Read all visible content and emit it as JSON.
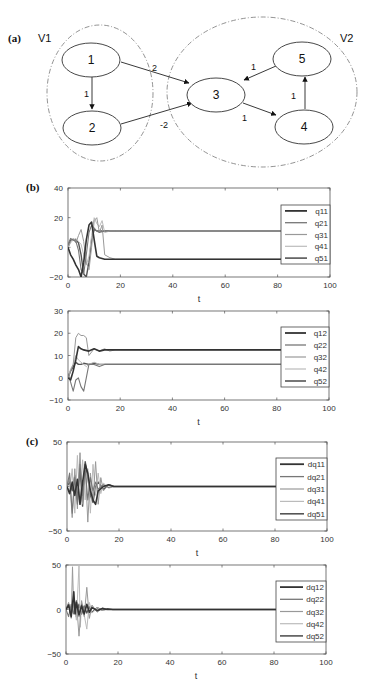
{
  "panel_labels": {
    "a": "(a)",
    "b": "(b)",
    "c": "(c)"
  },
  "diagram": {
    "sets": [
      {
        "label": "V1",
        "cx": 100,
        "cy": 93,
        "rx": 53,
        "ry": 68,
        "label_x": 38,
        "label_y": 42
      },
      {
        "label": "V2",
        "cx": 262,
        "cy": 92,
        "rx": 95,
        "ry": 75,
        "label_x": 340,
        "label_y": 42
      }
    ],
    "nodes": [
      {
        "id": "1",
        "label": "1",
        "cx": 91,
        "cy": 60,
        "rx": 29,
        "ry": 17
      },
      {
        "id": "2",
        "label": "2",
        "cx": 92,
        "cy": 128,
        "rx": 29,
        "ry": 17
      },
      {
        "id": "3",
        "label": "3",
        "cx": 216,
        "cy": 95,
        "rx": 29,
        "ry": 17
      },
      {
        "id": "4",
        "label": "4",
        "cx": 304,
        "cy": 127,
        "rx": 29,
        "ry": 17
      },
      {
        "id": "5",
        "label": "5",
        "cx": 302,
        "cy": 59,
        "rx": 29,
        "ry": 17
      }
    ],
    "edges": [
      {
        "from": "1",
        "to": "2",
        "weight": "1",
        "x1": 92,
        "y1": 77,
        "x2": 92,
        "y2": 109,
        "lx": 84,
        "ly": 97
      },
      {
        "from": "1",
        "to": "3",
        "weight": "2",
        "x1": 121,
        "y1": 62,
        "x2": 189,
        "y2": 83,
        "lx": 152,
        "ly": 71
      },
      {
        "from": "2",
        "to": "3",
        "weight": "-2",
        "x1": 121,
        "y1": 124,
        "x2": 192,
        "y2": 103,
        "lx": 160,
        "ly": 128
      },
      {
        "from": "3",
        "to": "4",
        "weight": "1",
        "x1": 243,
        "y1": 103,
        "x2": 276,
        "y2": 115,
        "lx": 242,
        "ly": 121
      },
      {
        "from": "4",
        "to": "5",
        "weight": "1",
        "x1": 305,
        "y1": 109,
        "x2": 305,
        "y2": 77,
        "lx": 291,
        "ly": 99
      },
      {
        "from": "5",
        "to": "3",
        "weight": "1",
        "x1": 276,
        "y1": 66,
        "x2": 244,
        "y2": 80,
        "lx": 251,
        "ly": 70
      }
    ]
  },
  "chart_data": [
    {
      "type": "line",
      "panel": "(b)",
      "title": "",
      "xlabel": "t",
      "ylabel": "",
      "xlim": [
        0,
        100
      ],
      "ylim": [
        -20,
        40
      ],
      "xticks": [
        0,
        20,
        40,
        60,
        80,
        100
      ],
      "yticks": [
        -20,
        0,
        20,
        40
      ],
      "grid": false,
      "legend_position": "right",
      "frame": {
        "x": 68,
        "y": 188,
        "w": 262,
        "h": 89
      },
      "legend_box": {
        "x": 281,
        "y": 205,
        "w": 49,
        "h": 59
      },
      "series": [
        {
          "name": "q11",
          "color": "#333333",
          "width": 1.6,
          "x": [
            0,
            1,
            2,
            3,
            4,
            5,
            6,
            7,
            8,
            9,
            10,
            11,
            12,
            14,
            16,
            18,
            20,
            100
          ],
          "y": [
            0,
            -5,
            -8,
            -12,
            -15,
            -20,
            -10,
            5,
            15,
            17,
            5,
            -6,
            -7,
            -8,
            -8,
            -8,
            -8,
            -8
          ]
        },
        {
          "name": "q21",
          "color": "#777777",
          "width": 1.1,
          "x": [
            0,
            1,
            2,
            3,
            4,
            5,
            6,
            7,
            8,
            9,
            10,
            11,
            12,
            14,
            16,
            18,
            20,
            100
          ],
          "y": [
            2,
            6,
            5,
            4,
            -2,
            -15,
            -18,
            -5,
            10,
            15,
            13,
            11,
            10,
            11,
            11,
            11,
            11,
            11
          ]
        },
        {
          "name": "q31",
          "color": "#999999",
          "width": 1.0,
          "x": [
            0,
            1,
            2,
            3,
            4,
            5,
            6,
            7,
            8,
            9,
            10,
            11,
            12,
            13,
            14,
            16,
            18,
            20,
            100
          ],
          "y": [
            0,
            4,
            6,
            3,
            8,
            12,
            4,
            -10,
            -15,
            0,
            18,
            20,
            10,
            15,
            -5,
            -7,
            -8,
            -8,
            -8
          ]
        },
        {
          "name": "q41",
          "color": "#bbbbbb",
          "width": 1.0,
          "x": [
            0,
            1,
            2,
            3,
            4,
            5,
            6,
            7,
            8,
            9,
            10,
            11,
            12,
            13,
            14,
            16,
            18,
            20,
            100
          ],
          "y": [
            0,
            3,
            5,
            6,
            4,
            2,
            -5,
            -12,
            -6,
            8,
            20,
            16,
            14,
            18,
            10,
            11,
            11,
            11,
            11
          ]
        },
        {
          "name": "q51",
          "color": "#555555",
          "width": 1.4,
          "x": [
            0,
            1,
            2,
            3,
            4,
            5,
            6,
            7,
            8,
            9,
            10,
            11,
            12,
            14,
            16,
            18,
            20,
            100
          ],
          "y": [
            0,
            5,
            5,
            5,
            3,
            -5,
            -18,
            -20,
            -10,
            5,
            12,
            11,
            11,
            11,
            11,
            11,
            11,
            11
          ]
        }
      ]
    },
    {
      "type": "line",
      "panel": "(b)",
      "title": "",
      "xlabel": "t",
      "ylabel": "",
      "xlim": [
        0,
        100
      ],
      "ylim": [
        -10,
        30
      ],
      "xticks": [
        0,
        20,
        40,
        60,
        80,
        100
      ],
      "yticks": [
        -10,
        0,
        10,
        20,
        30
      ],
      "grid": false,
      "legend_position": "right",
      "frame": {
        "x": 68,
        "y": 311,
        "w": 261,
        "h": 89
      },
      "legend_box": {
        "x": 281,
        "y": 327,
        "w": 48,
        "h": 60
      },
      "series": [
        {
          "name": "q12",
          "color": "#333333",
          "width": 1.6,
          "x": [
            0,
            1,
            2,
            3,
            4,
            5,
            6,
            8,
            10,
            12,
            14,
            16,
            18,
            20,
            100
          ],
          "y": [
            0,
            -1,
            3,
            8,
            14,
            13,
            12.5,
            12,
            13,
            12,
            12.5,
            12.5,
            12.5,
            12.5,
            12.5
          ]
        },
        {
          "name": "q22",
          "color": "#777777",
          "width": 1.1,
          "x": [
            0,
            1,
            2,
            3,
            4,
            5,
            6,
            7,
            8,
            10,
            12,
            14,
            16,
            18,
            20,
            100
          ],
          "y": [
            2,
            -2,
            -6,
            -1,
            0,
            -4,
            -6,
            0,
            6,
            6,
            5,
            6,
            6,
            6,
            6,
            6
          ]
        },
        {
          "name": "q32",
          "color": "#999999",
          "width": 1.0,
          "x": [
            0,
            1,
            2,
            3,
            4,
            5,
            6,
            7,
            8,
            10,
            12,
            14,
            16,
            18,
            20,
            100
          ],
          "y": [
            0,
            3,
            6,
            18,
            20,
            19,
            19,
            18,
            10,
            13,
            12,
            13,
            12,
            12.5,
            12.5,
            12.5
          ]
        },
        {
          "name": "q42",
          "color": "#bbbbbb",
          "width": 1.0,
          "x": [
            0,
            1,
            2,
            3,
            4,
            5,
            6,
            7,
            8,
            10,
            12,
            14,
            16,
            18,
            20,
            100
          ],
          "y": [
            0,
            4,
            6,
            10,
            8,
            7,
            6,
            5,
            6,
            7,
            6,
            6,
            6,
            6,
            6,
            6
          ]
        },
        {
          "name": "q52",
          "color": "#555555",
          "width": 1.4,
          "x": [
            0,
            1,
            2,
            3,
            4,
            5,
            6,
            8,
            10,
            12,
            14,
            16,
            18,
            20,
            100
          ],
          "y": [
            0,
            3,
            5,
            7,
            6,
            6,
            6.5,
            6,
            6.5,
            6,
            6,
            6,
            6,
            6,
            6
          ]
        }
      ]
    },
    {
      "type": "line",
      "panel": "(c)",
      "title": "",
      "xlabel": "t",
      "ylabel": "",
      "xlim": [
        0,
        100
      ],
      "ylim": [
        -50,
        50
      ],
      "xticks": [
        0,
        20,
        40,
        60,
        80,
        100
      ],
      "yticks": [
        -50,
        0,
        50
      ],
      "grid": false,
      "legend_position": "right",
      "frame": {
        "x": 67,
        "y": 442,
        "w": 260,
        "h": 89
      },
      "legend_box": {
        "x": 276,
        "y": 458,
        "w": 51,
        "h": 62
      },
      "series": [
        {
          "name": "dq11",
          "color": "#333333",
          "width": 1.6,
          "x": [
            0,
            1,
            2,
            3,
            4,
            5,
            6,
            7,
            8,
            9,
            10,
            11,
            12,
            14,
            16,
            18,
            20,
            100
          ],
          "y": [
            0,
            -8,
            5,
            -10,
            8,
            -20,
            5,
            25,
            15,
            -5,
            -15,
            -20,
            -5,
            0,
            2,
            0,
            0,
            0
          ]
        },
        {
          "name": "dq21",
          "color": "#777777",
          "width": 1.1,
          "x": [
            0,
            1,
            2,
            3,
            4,
            5,
            6,
            7,
            8,
            9,
            10,
            11,
            12,
            14,
            16,
            18,
            20,
            100
          ],
          "y": [
            0,
            15,
            -30,
            10,
            -20,
            25,
            -10,
            20,
            -15,
            10,
            -5,
            5,
            -3,
            2,
            -1,
            0,
            0,
            0
          ]
        },
        {
          "name": "dq31",
          "color": "#999999",
          "width": 1.0,
          "x": [
            0,
            1,
            2,
            3,
            4,
            5,
            6,
            7,
            8,
            9,
            10,
            11,
            12,
            13,
            14,
            16,
            18,
            20,
            100
          ],
          "y": [
            0,
            10,
            -35,
            20,
            -25,
            38,
            -20,
            25,
            -40,
            15,
            -15,
            28,
            -20,
            10,
            -5,
            2,
            0,
            0,
            0
          ]
        },
        {
          "name": "dq41",
          "color": "#bbbbbb",
          "width": 1.0,
          "x": [
            0,
            1,
            2,
            3,
            4,
            5,
            6,
            7,
            8,
            9,
            10,
            11,
            12,
            13,
            14,
            16,
            18,
            20,
            100
          ],
          "y": [
            0,
            -5,
            20,
            -30,
            35,
            -20,
            30,
            -15,
            20,
            -30,
            25,
            -10,
            15,
            -8,
            4,
            -2,
            0,
            0,
            0
          ]
        },
        {
          "name": "dq51",
          "color": "#555555",
          "width": 1.4,
          "x": [
            0,
            1,
            2,
            3,
            4,
            5,
            6,
            7,
            8,
            9,
            10,
            11,
            12,
            14,
            16,
            18,
            20,
            100
          ],
          "y": [
            0,
            5,
            -5,
            12,
            -15,
            20,
            -22,
            28,
            10,
            -10,
            -18,
            0,
            5,
            -3,
            2,
            0,
            0,
            0
          ]
        }
      ]
    },
    {
      "type": "line",
      "panel": "(c)",
      "title": "",
      "xlabel": "t",
      "ylabel": "",
      "xlim": [
        0,
        100
      ],
      "ylim": [
        -50,
        50
      ],
      "xticks": [
        0,
        20,
        40,
        60,
        80,
        100
      ],
      "yticks": [
        -50,
        0,
        50
      ],
      "grid": false,
      "legend_position": "right",
      "frame": {
        "x": 66,
        "y": 565,
        "w": 260,
        "h": 89
      },
      "legend_box": {
        "x": 276,
        "y": 581,
        "w": 50,
        "h": 61
      },
      "series": [
        {
          "name": "dq12",
          "color": "#333333",
          "width": 1.6,
          "x": [
            0,
            1,
            2,
            3,
            3.5,
            4,
            5,
            6,
            7,
            8,
            9,
            10,
            12,
            14,
            16,
            18,
            20,
            100
          ],
          "y": [
            0,
            5,
            -8,
            20,
            -5,
            8,
            -6,
            4,
            -5,
            6,
            -3,
            2,
            -1,
            1,
            0,
            0,
            0,
            0
          ]
        },
        {
          "name": "dq22",
          "color": "#777777",
          "width": 1.1,
          "x": [
            0,
            1,
            2,
            3,
            4,
            5,
            6,
            7,
            8,
            9,
            10,
            12,
            14,
            16,
            18,
            20,
            100
          ],
          "y": [
            0,
            -8,
            6,
            -5,
            10,
            -8,
            6,
            -4,
            5,
            -3,
            3,
            -2,
            1,
            0,
            0,
            0,
            0
          ]
        },
        {
          "name": "dq32",
          "color": "#999999",
          "width": 1.0,
          "x": [
            0,
            1,
            2,
            2.5,
            3,
            4,
            5,
            6,
            7,
            8,
            9,
            10,
            12,
            14,
            16,
            18,
            20,
            100
          ],
          "y": [
            0,
            8,
            -10,
            48,
            -5,
            10,
            -30,
            10,
            -8,
            25,
            -10,
            5,
            -3,
            2,
            0,
            0,
            0,
            0
          ]
        },
        {
          "name": "dq42",
          "color": "#bbbbbb",
          "width": 1.0,
          "x": [
            0,
            1,
            2,
            3,
            4,
            5,
            5.5,
            6,
            7,
            8,
            9,
            10,
            12,
            14,
            16,
            18,
            20,
            100
          ],
          "y": [
            0,
            5,
            -6,
            10,
            -12,
            50,
            -20,
            8,
            -6,
            -22,
            8,
            -4,
            2,
            -1,
            0,
            0,
            0,
            0
          ]
        },
        {
          "name": "dq52",
          "color": "#555555",
          "width": 1.4,
          "x": [
            0,
            1,
            2,
            3,
            4,
            5,
            6,
            7,
            8,
            9,
            10,
            12,
            14,
            16,
            18,
            20,
            100
          ],
          "y": [
            0,
            6,
            -6,
            8,
            -8,
            6,
            -5,
            4,
            -4,
            3,
            -3,
            2,
            -1,
            1,
            0,
            0,
            0
          ]
        }
      ]
    }
  ]
}
